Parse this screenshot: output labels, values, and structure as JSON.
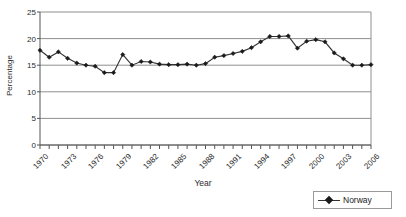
{
  "chart_data": {
    "type": "line",
    "title": "",
    "xlabel": "Year",
    "ylabel": "Percentage",
    "ylim": [
      0,
      25
    ],
    "ytick_values": [
      0,
      5,
      10,
      15,
      20,
      25
    ],
    "ytick_labels": [
      "0",
      "5",
      "10",
      "15",
      "20",
      "25"
    ],
    "xlim": [
      1970,
      2006
    ],
    "xtick_labels": [
      "1970",
      "1973",
      "1976",
      "1979",
      "1982",
      "1985",
      "1988",
      "1991",
      "1994",
      "1997",
      "2000",
      "2003",
      "2006"
    ],
    "xtick_interval": 3,
    "grid": "horizontal",
    "legend_position": "bottom-right",
    "marker": "diamond",
    "x": [
      1970,
      1971,
      1972,
      1973,
      1974,
      1975,
      1976,
      1977,
      1978,
      1979,
      1980,
      1981,
      1982,
      1983,
      1984,
      1985,
      1986,
      1987,
      1988,
      1989,
      1990,
      1991,
      1992,
      1993,
      1994,
      1995,
      1996,
      1997,
      1998,
      1999,
      2000,
      2001,
      2002,
      2003,
      2004,
      2005,
      2006
    ],
    "series": [
      {
        "name": "Norway",
        "color": "#333333",
        "values": [
          17.8,
          16.5,
          17.5,
          16.3,
          15.4,
          15.0,
          14.8,
          13.6,
          13.6,
          17.0,
          15.0,
          15.7,
          15.6,
          15.2,
          15.1,
          15.1,
          15.2,
          15.0,
          15.3,
          16.5,
          16.8,
          17.2,
          17.6,
          18.3,
          19.4,
          20.4,
          20.4,
          20.5,
          18.2,
          19.5,
          19.8,
          19.4,
          17.3,
          16.2,
          15.0,
          15.0,
          15.1
        ]
      }
    ],
    "legend": [
      {
        "label": "Norway"
      }
    ]
  },
  "geometry": {
    "plot_left": 40,
    "plot_right": 371,
    "plot_top": 12,
    "plot_bottom": 145
  }
}
